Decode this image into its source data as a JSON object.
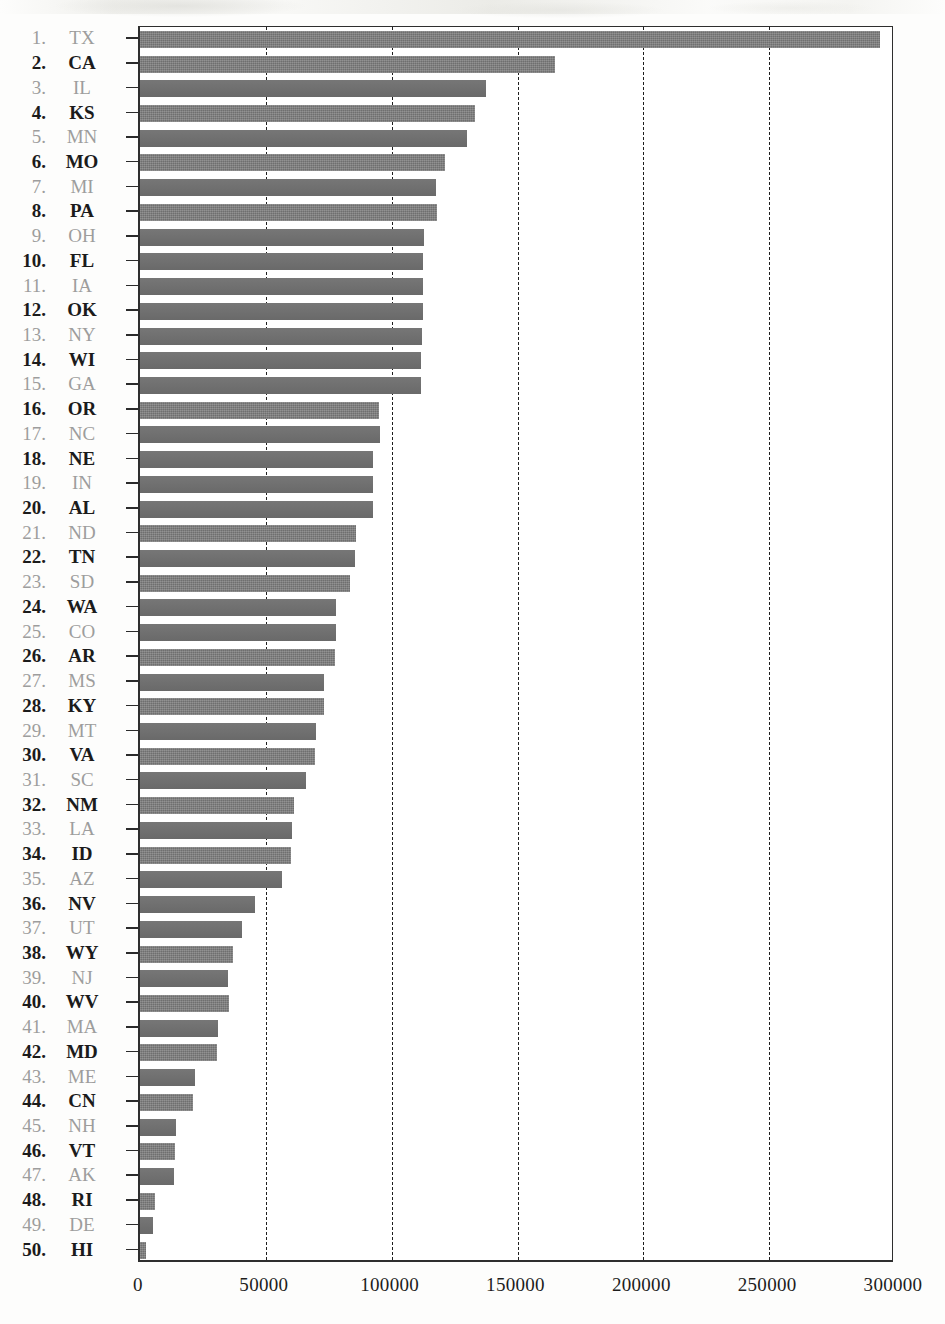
{
  "chart_data": {
    "type": "bar",
    "orientation": "horizontal",
    "title": "",
    "subtitle": "",
    "xlabel": "",
    "ylabel": "",
    "xlim": [
      0,
      300000
    ],
    "ylim": null,
    "grid": true,
    "grid_style": "dashed vertical gridlines",
    "legend": null,
    "xticks": [
      "0",
      "50000",
      "100000",
      "150000",
      "200000",
      "250000",
      "300000"
    ],
    "xtick_values": [
      0,
      50000,
      100000,
      150000,
      200000,
      250000,
      300000
    ],
    "categories": [
      "TX",
      "CA",
      "IL",
      "KS",
      "MN",
      "MO",
      "MI",
      "PA",
      "OH",
      "FL",
      "IA",
      "OK",
      "NY",
      "WI",
      "GA",
      "OR",
      "NC",
      "NE",
      "IN",
      "AL",
      "ND",
      "TN",
      "SD",
      "WA",
      "CO",
      "AR",
      "MS",
      "KY",
      "MT",
      "VA",
      "SC",
      "NM",
      "LA",
      "ID",
      "AZ",
      "NV",
      "UT",
      "WY",
      "NJ",
      "WV",
      "MA",
      "MD",
      "ME",
      "CN",
      "NH",
      "VT",
      "AK",
      "RI",
      "DE",
      "HI"
    ],
    "ranks": [
      1,
      2,
      3,
      4,
      5,
      6,
      7,
      8,
      9,
      10,
      11,
      12,
      13,
      14,
      15,
      16,
      17,
      18,
      19,
      20,
      21,
      22,
      23,
      24,
      25,
      26,
      27,
      28,
      29,
      30,
      31,
      32,
      33,
      34,
      35,
      36,
      37,
      38,
      39,
      40,
      41,
      42,
      43,
      44,
      45,
      46,
      47,
      48,
      49,
      50
    ],
    "values": [
      294000,
      165000,
      137500,
      133000,
      130000,
      121000,
      117500,
      118000,
      113000,
      112500,
      112500,
      112500,
      112000,
      111500,
      111500,
      95000,
      95500,
      92500,
      92500,
      92500,
      86000,
      85500,
      83500,
      78000,
      78000,
      77500,
      73000,
      73000,
      70000,
      69500,
      66000,
      61000,
      60500,
      60000,
      56500,
      45500,
      40500,
      37000,
      35000,
      35500,
      31000,
      30500,
      22000,
      21000,
      14500,
      14000,
      13500,
      6000,
      5000,
      2500
    ],
    "bar_styles": [
      "tex",
      "tex",
      "plain",
      "tex",
      "plain",
      "tex",
      "plain",
      "tex",
      "plain",
      "plain",
      "plain",
      "plain",
      "plain",
      "plain",
      "plain",
      "tex",
      "plain",
      "plain",
      "plain",
      "plain",
      "tex",
      "plain",
      "tex",
      "plain",
      "plain",
      "tex",
      "plain",
      "tex",
      "plain",
      "tex",
      "plain",
      "tex",
      "plain",
      "tex",
      "plain",
      "plain",
      "plain",
      "tex",
      "plain",
      "tex",
      "plain",
      "tex",
      "plain",
      "tex",
      "plain",
      "tex",
      "plain",
      "tex",
      "plain",
      "tex"
    ],
    "label_emphasis": [
      "light",
      "bold",
      "light",
      "bold",
      "light",
      "bold",
      "light",
      "bold",
      "light",
      "bold",
      "light",
      "bold",
      "light",
      "bold",
      "light",
      "bold",
      "light",
      "bold",
      "light",
      "bold",
      "light",
      "bold",
      "light",
      "bold",
      "light",
      "bold",
      "light",
      "bold",
      "light",
      "bold",
      "light",
      "bold",
      "light",
      "bold",
      "light",
      "bold",
      "light",
      "bold",
      "light",
      "bold",
      "light",
      "bold",
      "light",
      "bold",
      "light",
      "bold",
      "light",
      "bold",
      "light",
      "bold"
    ]
  },
  "style": {
    "bar_color": "#787878",
    "bar_color_textured": "#7c7c7c",
    "axis_color": "#2e2e2e",
    "grid_color": "#1e1e1e",
    "label_bold_color": "#1b1b1b",
    "label_light_color": "#9d9d9d",
    "background": "#ffffff"
  }
}
